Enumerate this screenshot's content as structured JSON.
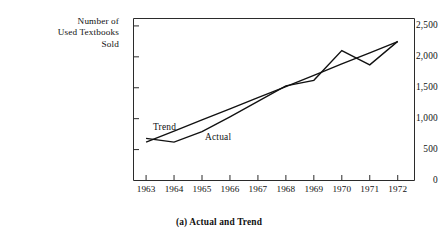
{
  "figure": {
    "caption": "(a) Actual and Trend",
    "yaxis_title_lines": [
      "Number of",
      "Used Textbooks",
      "Sold"
    ]
  },
  "chart_data": {
    "type": "line",
    "title": "",
    "caption": "(a) Actual and Trend",
    "xlabel": "",
    "ylabel": "Number of Used Textbooks Sold",
    "categories": [
      1963,
      1964,
      1965,
      1966,
      1967,
      1968,
      1969,
      1970,
      1971,
      1972
    ],
    "xtick_labels": [
      "1963",
      "1964",
      "1965",
      "1966",
      "1967",
      "1968",
      "1969",
      "1970",
      "1971",
      "1972"
    ],
    "ytick_labels": [
      "0",
      "500",
      "1,000",
      "1,500",
      "2,000",
      "2,500"
    ],
    "yticks": [
      0,
      500,
      1000,
      1500,
      2000,
      2500
    ],
    "ylim": [
      0,
      2620
    ],
    "xlim": [
      1962.55,
      1972.6
    ],
    "grid": false,
    "legend": "inline-labels",
    "series": [
      {
        "name": "Actual",
        "label": "Actual",
        "values": [
          680,
          620,
          790,
          1030,
          1280,
          1530,
          1620,
          2100,
          1870,
          2250
        ]
      },
      {
        "name": "Trend",
        "label": "Trend",
        "values": [
          620,
          800,
          980,
          1160,
          1340,
          1520,
          1700,
          1885,
          2065,
          2245
        ]
      }
    ]
  }
}
